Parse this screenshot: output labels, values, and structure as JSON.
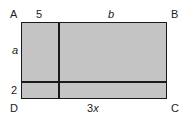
{
  "diagram": {
    "type": "rectangle-area-model",
    "vertices": {
      "top_left": "A",
      "top_right": "B",
      "bottom_right": "C",
      "bottom_left": "D"
    },
    "top_labels": {
      "left_segment": "5",
      "right_segment": "b"
    },
    "left_labels": {
      "top_segment": "a",
      "bottom_segment": "2"
    },
    "bottom_labels": {
      "right_segment": "3x"
    },
    "fill_color": "#c4c4c4",
    "line_color": "#1a1a1a"
  }
}
